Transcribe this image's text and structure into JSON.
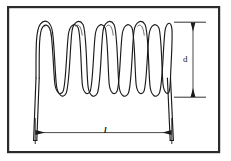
{
  "figure": {
    "background_color": "#ffffff",
    "line_color": "#1a1a1a",
    "frame": {
      "name": "figure-border",
      "color": "#2b2b2b",
      "x": 7,
      "y": 6,
      "width": 213,
      "height": 147,
      "stroke_width": 2.2
    },
    "coil": {
      "name": "helical-spring",
      "peak_count": 7,
      "valley_count": 7,
      "top_y": 22,
      "bottom_y": 97,
      "left_x": 34,
      "right_x": 172,
      "stroke_color": "#1a1a1a",
      "stroke_width": 1.1,
      "wire_gap": 3.2
    },
    "legs": {
      "name": "spring-end-legs",
      "left_leg": {
        "top_x": 36,
        "top_y": 78,
        "bottom_x": 33,
        "bottom_y": 140
      },
      "right_leg": {
        "top_x": 170,
        "top_y": 78,
        "bottom_x": 173,
        "bottom_y": 140
      }
    },
    "dimensions": [
      {
        "name": "dimension-d",
        "label": "d",
        "orientation": "vertical",
        "axis_x": 193,
        "start_y": 22,
        "end_y": 97,
        "extension_from_x": 172,
        "extension_to_x": 205,
        "label_x": 183,
        "label_y": 55
      },
      {
        "name": "dimension-l",
        "label": "l",
        "orientation": "horizontal",
        "axis_y": 133,
        "start_x": 36,
        "end_x": 171,
        "extension_top_y": 118,
        "extension_bottom_y": 143,
        "label_x": 104,
        "label_y": 126
      }
    ]
  }
}
